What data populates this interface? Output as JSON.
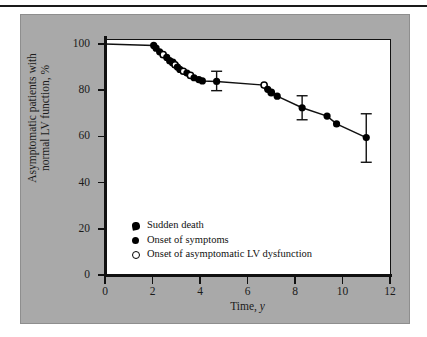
{
  "figure": {
    "panel_bg": "#a9a9a9",
    "plot_bg": "#ffffff",
    "axis_color": "#111111",
    "marker_color": "#000000"
  },
  "axis": {
    "y_label_line1": "Asymptomatic patients with",
    "y_label_line2": "normal LV function, %",
    "x_label_text": "Time, ",
    "x_label_italic": "y",
    "y_ticks": [
      "0",
      "20",
      "40",
      "60",
      "80",
      "100"
    ],
    "x_ticks": [
      "0",
      "2",
      "4",
      "6",
      "8",
      "10",
      "12"
    ]
  },
  "legend": {
    "items": [
      {
        "marker": "half-filled-circle-icon",
        "label": "Sudden death"
      },
      {
        "marker": "filled-circle-icon",
        "label": "Onset of symptoms"
      },
      {
        "marker": "open-circle-icon",
        "label": "Onset of asymptomatic LV dysfunction"
      }
    ]
  },
  "chart_data": {
    "type": "line",
    "title": "",
    "subtitle": "",
    "xlabel": "Time, y",
    "ylabel": "Asymptomatic patients with normal LV function, %",
    "xlim": [
      0,
      12
    ],
    "ylim": [
      0,
      100
    ],
    "xticks": [
      0,
      2,
      4,
      6,
      8,
      10,
      12
    ],
    "yticks": [
      0,
      20,
      40,
      60,
      80,
      100
    ],
    "grid": false,
    "legend_position": "inside-lower-left",
    "series": [
      {
        "name": "Event-free survival",
        "x": [
          0.0,
          2.05,
          2.15,
          2.3,
          2.45,
          2.6,
          2.72,
          2.85,
          2.95,
          3.05,
          3.15,
          3.3,
          3.45,
          3.6,
          3.75,
          3.95,
          4.1,
          4.7,
          6.7,
          6.85,
          7.0,
          7.25,
          8.3,
          9.35,
          9.75,
          11.0
        ],
        "y": [
          100.0,
          99.4,
          98.2,
          96.6,
          95.4,
          94.2,
          92.8,
          92.0,
          91.0,
          90.0,
          89.0,
          88.2,
          87.4,
          86.4,
          85.4,
          84.6,
          84.0,
          83.8,
          82.2,
          80.4,
          79.0,
          77.4,
          72.4,
          68.8,
          65.4,
          59.5
        ],
        "marker_types": [
          "none",
          "filled",
          "filled",
          "filled",
          "open",
          "filled",
          "filled",
          "half",
          "open",
          "filled",
          "filled",
          "open",
          "filled",
          "open",
          "filled",
          "filled",
          "filled",
          "filled",
          "open",
          "filled",
          "half",
          "filled",
          "filled",
          "filled",
          "filled",
          "filled"
        ]
      }
    ],
    "error_bars": [
      {
        "x": 4.7,
        "y": 83.8,
        "low": 79.8,
        "high": 88.2
      },
      {
        "x": 8.3,
        "y": 72.4,
        "low": 67.2,
        "high": 77.6
      },
      {
        "x": 11.0,
        "y": 59.5,
        "low": 48.8,
        "high": 69.8
      }
    ]
  }
}
